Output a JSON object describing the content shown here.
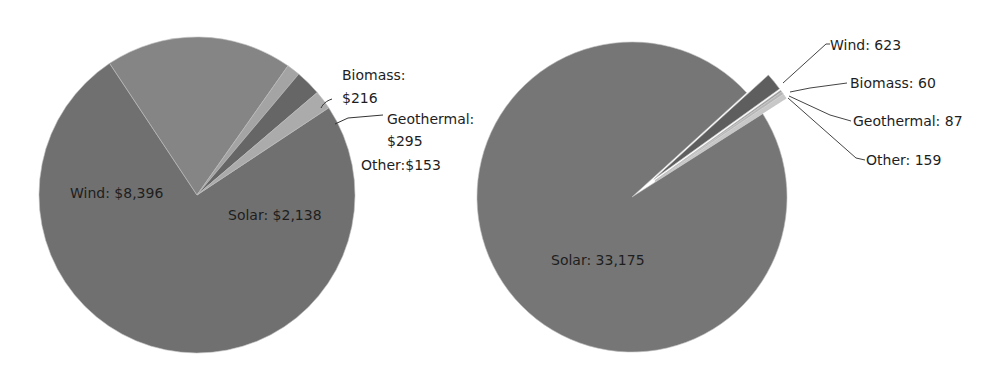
{
  "chart_data": [
    {
      "type": "pie",
      "title": "",
      "units": "$",
      "categories": [
        "Wind",
        "Solar",
        "Other",
        "Geothermal",
        "Biomass"
      ],
      "values": [
        8396,
        2138,
        153,
        295,
        216
      ],
      "labels": [
        "Wind: $8,396",
        "Solar: $2,138",
        "Other:$153",
        "Geothermal:",
        "Biomass:"
      ],
      "label_values": [
        "",
        "",
        "",
        "$295",
        "$216"
      ],
      "colors": [
        "#707070",
        "#858585",
        "#a4a4a4",
        "#666666",
        "#ababab"
      ],
      "legend": "none"
    },
    {
      "type": "pie",
      "title": "",
      "units": "",
      "categories": [
        "Solar",
        "Wind",
        "Biomass",
        "Geothermal",
        "Other"
      ],
      "values": [
        33175,
        623,
        60,
        87,
        159
      ],
      "labels": [
        "Solar: 33,175",
        "Wind: 623",
        "Biomass: 60",
        "Geothermal: 87",
        "Other: 159"
      ],
      "colors": [
        "#767676",
        "#5e5e5e",
        "#9a9a9a",
        "#b5b5b5",
        "#c8c8c8"
      ],
      "exploded": [
        "Wind",
        "Biomass",
        "Geothermal",
        "Other"
      ],
      "legend": "none"
    }
  ]
}
